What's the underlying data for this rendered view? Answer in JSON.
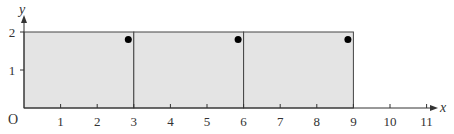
{
  "chart_data": {
    "type": "diagram",
    "xlabel": "x",
    "ylabel": "y",
    "origin_label": "O",
    "x_ticks": [
      "1",
      "2",
      "3",
      "4",
      "5",
      "6",
      "7",
      "8",
      "9",
      "10",
      "11"
    ],
    "y_ticks": [
      "1",
      "2"
    ],
    "xlim": [
      0,
      11
    ],
    "ylim": [
      0,
      2
    ],
    "rectangles": [
      {
        "x0": 0,
        "x1": 3,
        "y0": 0,
        "y1": 2
      },
      {
        "x0": 3,
        "x1": 6,
        "y0": 0,
        "y1": 2
      },
      {
        "x0": 6,
        "x1": 9,
        "y0": 0,
        "y1": 2
      }
    ],
    "points": [
      {
        "x": 2.85,
        "y": 1.8
      },
      {
        "x": 5.85,
        "y": 1.8
      },
      {
        "x": 8.85,
        "y": 1.8
      }
    ],
    "fill_color": "#e4e4e4",
    "line_color": "#444444"
  }
}
